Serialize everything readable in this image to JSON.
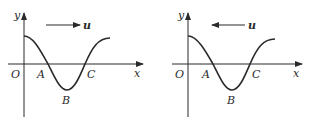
{
  "panels": [
    {
      "id": "left",
      "axis_y_label": "y",
      "axis_x_label": "x",
      "origin_label": "O",
      "points": {
        "A": "A",
        "B": "B",
        "C": "C"
      },
      "velocity_label": "u",
      "velocity_direction": "right"
    },
    {
      "id": "right",
      "axis_y_label": "y",
      "axis_x_label": "x",
      "origin_label": "O",
      "points": {
        "A": "A",
        "B": "B",
        "C": "C"
      },
      "velocity_label": "u",
      "velocity_direction": "left"
    }
  ],
  "colors": {
    "stroke": "#2a2a2a",
    "background": "#ffffff"
  }
}
